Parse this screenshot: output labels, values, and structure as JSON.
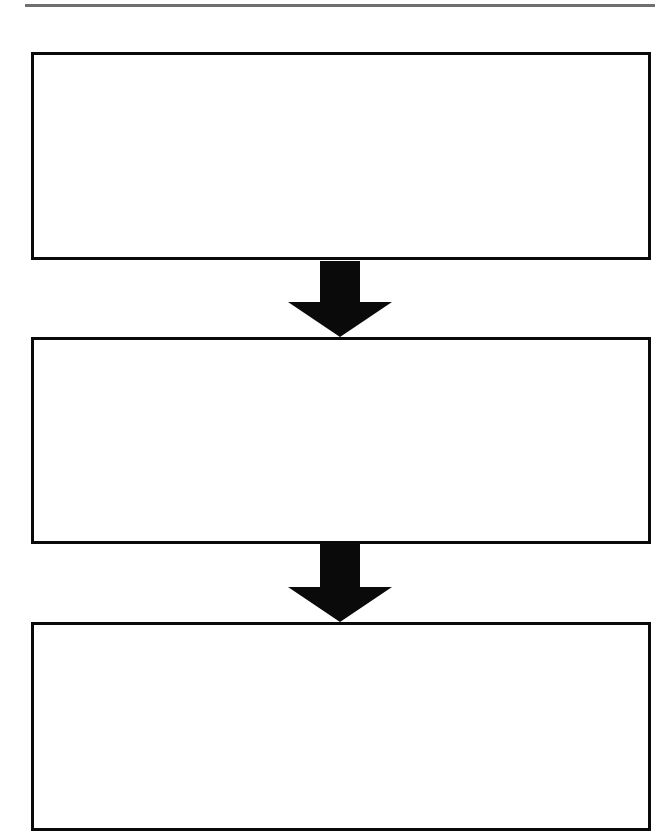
{
  "header": {
    "title_fragment": "",
    "rule_color": "#6f6f6f"
  },
  "flowchart": {
    "border_color": "#0a0a0a",
    "arrow_color": "#0a0a0a",
    "boxes": [
      {
        "id": 1,
        "text": ""
      },
      {
        "id": 2,
        "text": ""
      },
      {
        "id": 3,
        "text": ""
      }
    ],
    "arrows": [
      {
        "from": 1,
        "to": 2,
        "direction": "down"
      },
      {
        "from": 2,
        "to": 3,
        "direction": "down"
      }
    ]
  }
}
